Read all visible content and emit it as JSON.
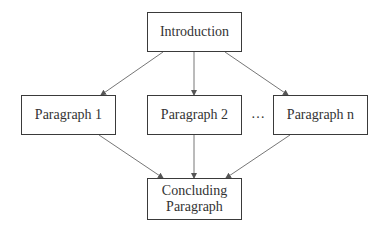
{
  "diagram": {
    "type": "flowchart",
    "nodes": {
      "introduction": {
        "label": "Introduction"
      },
      "paragraph_1": {
        "label": "Paragraph 1"
      },
      "paragraph_2": {
        "label": "Paragraph 2"
      },
      "paragraph_n": {
        "label": "Paragraph n"
      },
      "conclusion": {
        "line1": "Concluding",
        "line2": "Paragraph"
      }
    },
    "ellipsis": "…",
    "edges": [
      {
        "from": "Introduction",
        "to": "Paragraph 1"
      },
      {
        "from": "Introduction",
        "to": "Paragraph 2"
      },
      {
        "from": "Introduction",
        "to": "Paragraph n"
      },
      {
        "from": "Paragraph 1",
        "to": "Concluding Paragraph"
      },
      {
        "from": "Paragraph 2",
        "to": "Concluding Paragraph"
      },
      {
        "from": "Paragraph n",
        "to": "Concluding Paragraph"
      }
    ],
    "colors": {
      "line": "#555555",
      "border": "#3a3a3a",
      "text": "#333333"
    }
  }
}
